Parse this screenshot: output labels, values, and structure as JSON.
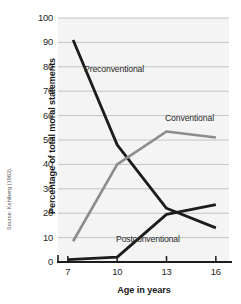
{
  "chart_data": {
    "type": "line",
    "title": "",
    "xlabel": "Age in years",
    "ylabel": "Percentage of total moral statements",
    "x": [
      7,
      10,
      13,
      16
    ],
    "xtick_labels": [
      "7",
      "10",
      "13",
      "16"
    ],
    "ytick_labels": [
      "0",
      "10",
      "20",
      "30",
      "40",
      "50",
      "60",
      "70",
      "80",
      "90",
      "100"
    ],
    "yticks": [
      0,
      10,
      20,
      30,
      40,
      50,
      60,
      70,
      80,
      90,
      100
    ],
    "ylim": [
      0,
      100
    ],
    "xlim": [
      6.4,
      16.8
    ],
    "grid": true,
    "legend": "inline-labels",
    "series": [
      {
        "name": "Preconventional",
        "color": "#1c1c1c",
        "values": [
          91,
          48,
          22,
          14
        ],
        "label_position": "upper-left"
      },
      {
        "name": "Conventional",
        "color": "#8c8c8c",
        "values": [
          8.5,
          40,
          53.5,
          51
        ],
        "label_position": "upper-right"
      },
      {
        "name": "Postconventional",
        "color": "#1c1c1c",
        "values": [
          1,
          2,
          19.5,
          23.5
        ],
        "label_position": "lower-center"
      }
    ],
    "source": "Source: Kohlberg (1963).",
    "plot_background": "#f4f4f4",
    "gridline_color": "#bdbdbd",
    "axis_color": "#1c1c1c"
  }
}
